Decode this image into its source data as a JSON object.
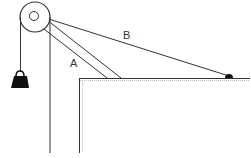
{
  "diagram": {
    "labels": {
      "boom": "A",
      "cable": "B"
    },
    "colors": {
      "line": "#333333",
      "weight": "#111111",
      "shading": "#bbbbbb"
    }
  }
}
